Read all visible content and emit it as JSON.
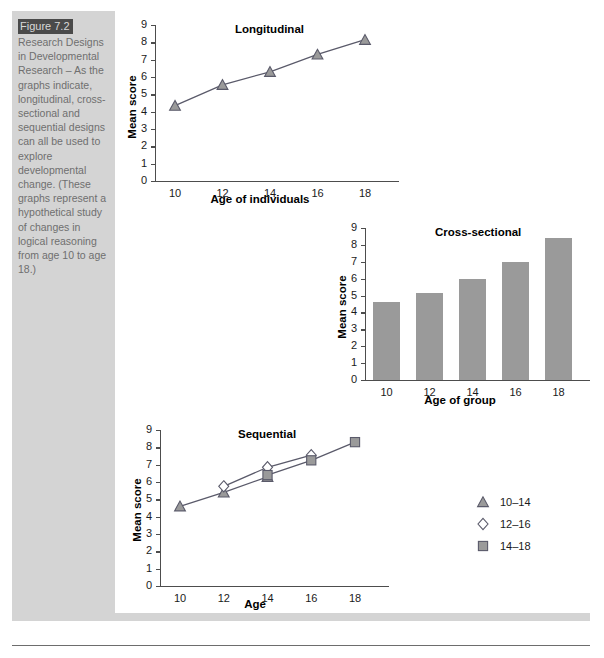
{
  "figure": {
    "number_label": "Figure 7.2",
    "caption": "Research Designs in Developmental Research – As the graphs indicate, longitudinal, cross-sectional and sequential designs can all be used to explore developmental change. (These graphs represent a hypothetical study of changes in logical reasoning from age 10 to age 18.)"
  },
  "colors": {
    "marker_fill": "#9a9a9a",
    "marker_stroke": "#5a5a6a",
    "line": "#5a5a6a",
    "bar_fill": "#9a9a9a",
    "axis": "#4d4d4d",
    "panel_bg": "#ffffff",
    "caption_bg": "#d4d4d4",
    "figure_number_bg": "#4a4a4a"
  },
  "chart_data": [
    {
      "type": "line",
      "title": "Longitudinal",
      "xlabel": "Age of individuals",
      "ylabel": "Mean score",
      "categories": [
        "10",
        "12",
        "14",
        "16",
        "18"
      ],
      "x": [
        10,
        12,
        14,
        16,
        18
      ],
      "values": [
        4.35,
        5.55,
        6.3,
        7.3,
        8.15
      ],
      "ylim": [
        0,
        9
      ],
      "yticks": [
        "0",
        "1",
        "2",
        "3",
        "4",
        "5",
        "6",
        "7",
        "8",
        "9"
      ],
      "grid": false,
      "marker": "triangle",
      "legend": null
    },
    {
      "type": "bar",
      "title": "Cross-sectional",
      "xlabel": "Age of group",
      "ylabel": "Mean score",
      "categories": [
        "10",
        "12",
        "14",
        "16",
        "18"
      ],
      "values": [
        4.6,
        5.15,
        6.0,
        7.0,
        8.4
      ],
      "ylim": [
        0,
        9
      ],
      "yticks": [
        "0",
        "1",
        "2",
        "3",
        "4",
        "5",
        "6",
        "7",
        "8",
        "9"
      ],
      "grid": false,
      "legend": null
    },
    {
      "type": "line",
      "title": "Sequential",
      "xlabel": "Age",
      "ylabel": "Mean score",
      "categories": [
        "10",
        "12",
        "14",
        "16",
        "18"
      ],
      "ylim": [
        0,
        9
      ],
      "yticks": [
        "0",
        "1",
        "2",
        "3",
        "4",
        "5",
        "6",
        "7",
        "8",
        "9"
      ],
      "grid": false,
      "legend_position": "right",
      "series": [
        {
          "name": "10–14",
          "marker": "triangle",
          "x": [
            10,
            12,
            14
          ],
          "values": [
            4.6,
            5.4,
            6.3
          ]
        },
        {
          "name": "12–16",
          "marker": "diamond",
          "x": [
            12,
            14,
            16
          ],
          "values": [
            5.75,
            6.85,
            7.55
          ]
        },
        {
          "name": "14–18",
          "marker": "square",
          "x": [
            14,
            16,
            18
          ],
          "values": [
            6.4,
            7.25,
            8.3
          ]
        }
      ]
    }
  ]
}
